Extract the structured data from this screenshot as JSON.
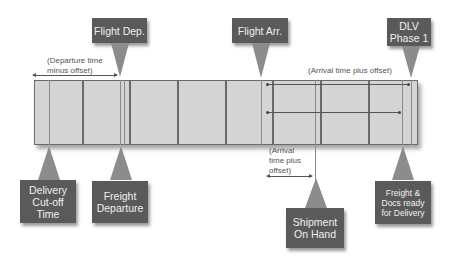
{
  "diagram": {
    "type": "timeline",
    "colors": {
      "callout_bg": "#5a5a5a",
      "callout_text": "#f0f0f0",
      "pointer": "#8c8c8c",
      "bar": "#d4d4d4",
      "bar_lines": "#6a6a6a"
    },
    "top_callouts": [
      {
        "id": "flight-dep",
        "label": "Flight Dep."
      },
      {
        "id": "flight-arr",
        "label": "Flight Arr."
      },
      {
        "id": "dlv-phase-1",
        "label_line1": "DLV",
        "label_line2": "Phase 1"
      }
    ],
    "bottom_callouts": [
      {
        "id": "delivery-cutoff",
        "label_line1": "Delivery",
        "label_line2": "Cut-off",
        "label_line3": "Time"
      },
      {
        "id": "freight-departure",
        "label_line1": "Freight",
        "label_line2": "Departure"
      },
      {
        "id": "shipment-on-hand",
        "label_line1": "Shipment",
        "label_line2": "On Hand"
      },
      {
        "id": "freight-docs-ready",
        "label_line1": "Freight &",
        "label_line2": "Docs ready",
        "label_line3": "for Delivery"
      }
    ],
    "annotations": {
      "departure_offset_line1": "(Departure time",
      "departure_offset_line2": "minus offset)",
      "arrival_offset_top": "(Arrival time  plus offset)",
      "arrival_offset_line1": "(Arrival",
      "arrival_offset_line2": "time plus",
      "arrival_offset_line3": "offset)"
    }
  }
}
